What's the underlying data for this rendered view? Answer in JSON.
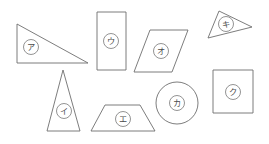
{
  "figure": {
    "background_color": "#ffffff",
    "stroke_color": "#6e6e6e",
    "label_text_color": "#4a4a4a",
    "label_circle_stroke": "#777777",
    "shapes": [
      {
        "id": "right-triangle",
        "label": "ア",
        "kind": "triangle",
        "points": "17,24 17,63 88,63",
        "label_x": 31,
        "label_y": 47,
        "label_r": 7.5
      },
      {
        "id": "tall-rectangle",
        "label": "ウ",
        "kind": "rectangle",
        "points": "97,12 126,12 126,70 97,70",
        "label_x": 111,
        "label_y": 41,
        "label_r": 7.5
      },
      {
        "id": "parallelogram",
        "label": "オ",
        "kind": "parallelogram",
        "points": "150,30 188,30 172,72 134,72",
        "label_x": 161,
        "label_y": 51,
        "label_r": 7.5
      },
      {
        "id": "thin-triangle",
        "label": "キ",
        "kind": "triangle",
        "points": "219,11 252,27 208,38",
        "label_x": 226,
        "label_y": 24,
        "label_r": 7.5
      },
      {
        "id": "isoceles-triangle",
        "label": "イ",
        "kind": "triangle",
        "points": "63,70 80,131 47,131",
        "label_x": 64,
        "label_y": 111,
        "label_r": 7.5
      },
      {
        "id": "trapezoid",
        "label": "エ",
        "kind": "trapezoid",
        "points": "105,105 140,105 155,131 91,131",
        "label_x": 123,
        "label_y": 119,
        "label_r": 7.5
      },
      {
        "id": "circle",
        "label": "カ",
        "kind": "circle",
        "cx": 177,
        "cy": 103,
        "r": 21,
        "label_x": 177,
        "label_y": 103,
        "label_r": 7.5
      },
      {
        "id": "square",
        "label": "ク",
        "kind": "square",
        "points": "213,70 253,70 253,113 213,113",
        "label_x": 233,
        "label_y": 92,
        "label_r": 7.5
      }
    ]
  }
}
